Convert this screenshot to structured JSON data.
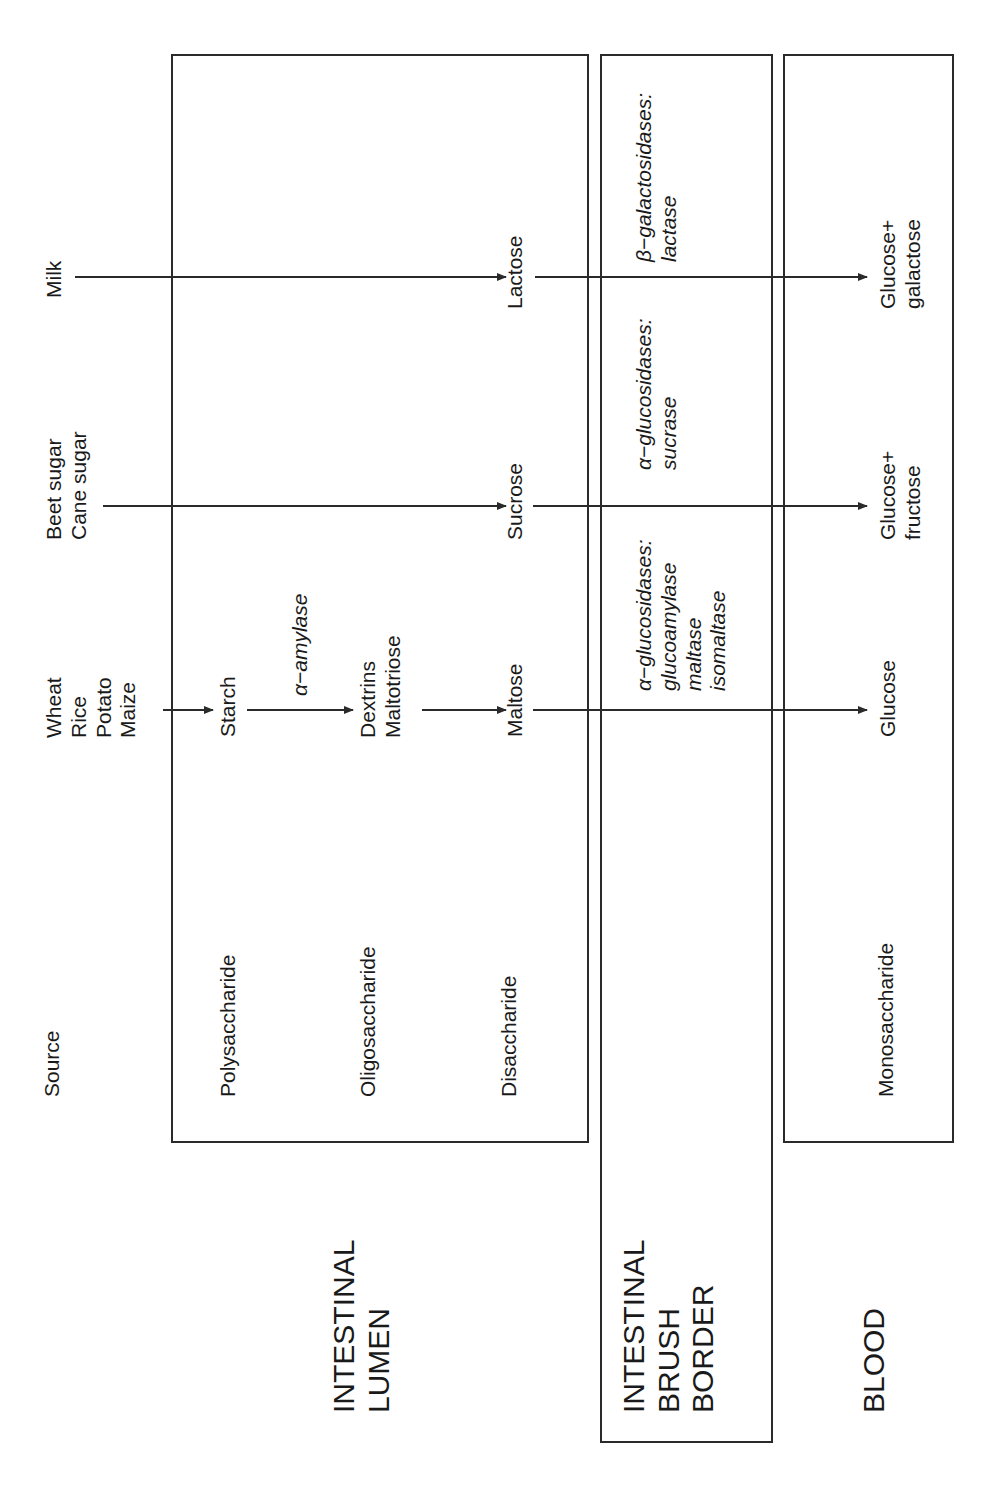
{
  "diagram": {
    "compartments": [
      {
        "id": "lumen",
        "label": "INTESTINAL\nLUMEN"
      },
      {
        "id": "brush_border",
        "label": "INTESTINAL\nBRUSH\nBORDER"
      },
      {
        "id": "blood",
        "label": "BLOOD"
      }
    ],
    "row_headers": {
      "source": "Source",
      "polysaccharide": "Polysaccharide",
      "oligosaccharide": "Oligosaccharide",
      "disaccharide": "Disaccharide",
      "monosaccharide": "Monosaccharide"
    },
    "sources": {
      "starch": "Wheat\nRice\nPotato\nMaize",
      "sucrose": "Beet sugar\nCane sugar",
      "lactose": "Milk"
    },
    "nodes": {
      "starch": "Starch",
      "dextrins": "Dextrins\nMaltotriose",
      "maltose": "Maltose",
      "sucrose": "Sucrose",
      "lactose": "Lactose",
      "glucose": "Glucose",
      "glucose_fructose": "Glucose+\nfructose",
      "glucose_galactose": "Glucose+\ngalactose"
    },
    "enzymes": {
      "amylase": "α−amylase",
      "maltose_enzymes": "α−glucosidases:\nglucoamylase\nmaltase\nisomaltase",
      "sucrose_enzymes": "α−glucosidases:\nsucrase",
      "lactose_enzymes": "β−galactosidases:\nlactase"
    },
    "line_color": "#2a2a2a"
  }
}
